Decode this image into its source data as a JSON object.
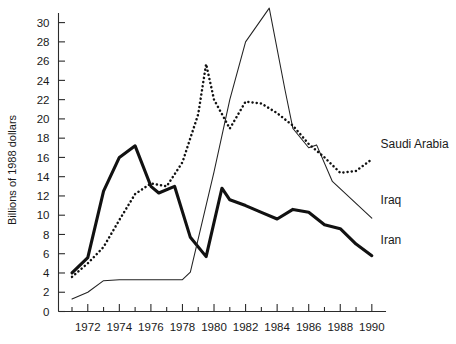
{
  "chart_data": {
    "type": "line",
    "title": "",
    "subtitle": "",
    "xlabel": "",
    "ylabel": "Billions of 1988 dollars",
    "xlim": [
      1971,
      1990.6
    ],
    "ylim": [
      0,
      31.8
    ],
    "grid": false,
    "legend_position": "inline-right-labels",
    "y_ticks": [
      0,
      2,
      4,
      6,
      8,
      10,
      12,
      14,
      16,
      18,
      20,
      22,
      24,
      26,
      28,
      30
    ],
    "y_tick_labels": [
      "0",
      "2",
      "4",
      "6",
      "8",
      "10",
      "12",
      "14",
      "16",
      "18",
      "20",
      "22",
      "24",
      "26",
      "28",
      "30"
    ],
    "x_ticks": [
      1971,
      1972,
      1973,
      1974,
      1975,
      1976,
      1977,
      1978,
      1979,
      1980,
      1981,
      1982,
      1983,
      1984,
      1985,
      1986,
      1987,
      1988,
      1989,
      1990
    ],
    "x_tick_labels_shown": [
      "1972",
      "1974",
      "1976",
      "1978",
      "1980",
      "1982",
      "1984",
      "1986",
      "1988",
      "1990"
    ],
    "x_tick_label_values": [
      1972,
      1974,
      1976,
      1978,
      1980,
      1982,
      1984,
      1986,
      1988,
      1990
    ],
    "series": [
      {
        "name": "Iran",
        "style": "thick-solid",
        "label_x": 1990.3,
        "label_y": 7.4,
        "x": [
          1971,
          1972,
          1973,
          1974,
          1975,
          1976,
          1976.5,
          1977.5,
          1978.5,
          1979.5,
          1980.5,
          1981,
          1982,
          1983,
          1984,
          1985,
          1986,
          1987,
          1988,
          1989,
          1990
        ],
        "values": [
          4.0,
          5.6,
          12.5,
          16.0,
          17.2,
          13.0,
          12.3,
          13.0,
          7.7,
          5.7,
          12.8,
          11.6,
          11.0,
          10.3,
          9.6,
          10.6,
          10.3,
          9.0,
          8.6,
          7.0,
          5.8
        ]
      },
      {
        "name": "Iraq",
        "style": "thin-solid",
        "label_x": 1990.3,
        "label_y": 11.6,
        "x": [
          1971,
          1972,
          1973,
          1974,
          1975,
          1976,
          1977,
          1978,
          1978.5,
          1980,
          1981,
          1982,
          1983.5,
          1984.5,
          1985,
          1986,
          1986.5,
          1987.5,
          1990
        ],
        "values": [
          1.3,
          2.0,
          3.2,
          3.3,
          3.3,
          3.3,
          3.3,
          3.3,
          4.1,
          14.5,
          22.0,
          28.0,
          31.5,
          23.0,
          19.0,
          17.0,
          17.3,
          13.5,
          9.7
        ]
      },
      {
        "name": "Saudi Arabia",
        "style": "dotted",
        "label_x": 1990.3,
        "label_y": 17.4,
        "x": [
          1971,
          1972,
          1973,
          1974,
          1975,
          1976,
          1977,
          1978,
          1979,
          1979.5,
          1980,
          1981,
          1982,
          1983,
          1984,
          1985,
          1986,
          1987,
          1988,
          1989,
          1990
        ],
        "values": [
          3.6,
          5.0,
          6.7,
          9.5,
          12.2,
          13.3,
          13.0,
          15.5,
          20.5,
          25.7,
          22.0,
          19.0,
          21.8,
          21.6,
          20.6,
          19.3,
          17.4,
          16.0,
          14.4,
          14.6,
          15.8
        ]
      }
    ]
  },
  "labels": {
    "saudi": "Saudi Arabia",
    "iraq": "Iraq",
    "iran": "Iran",
    "y_axis_title": "Billions of 1988 dollars"
  },
  "colors": {
    "ink": "#111111",
    "background": "#ffffff"
  }
}
